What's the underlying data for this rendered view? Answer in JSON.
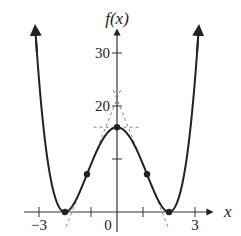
{
  "chart_data": {
    "type": "line",
    "title": "",
    "function": "f(x) = (x^2 - 4)^2 = x^4 - 8x^2 + 16",
    "xlabel": "x",
    "ylabel": "f(x)",
    "xlim": [
      -3.3,
      3.3
    ],
    "ylim": [
      0,
      34
    ],
    "x_ticks": [
      -3,
      -1,
      1,
      3
    ],
    "x_tick_labels": [
      "-3",
      "0",
      "3"
    ],
    "x_tick_label_positions": [
      -3,
      0,
      3
    ],
    "y_ticks": [
      10,
      20,
      30
    ],
    "y_tick_labels": [
      "20",
      "30"
    ],
    "y_tick_label_positions": [
      20,
      30
    ],
    "grid": false,
    "series": [
      {
        "name": "f(x)",
        "x": [
          -3.14,
          -3.0,
          -2.75,
          -2.5,
          -2.25,
          -2.0,
          -1.75,
          -1.5,
          -1.155,
          -1.0,
          -0.75,
          -0.5,
          -0.25,
          0,
          0.25,
          0.5,
          0.75,
          1.0,
          1.155,
          1.5,
          1.75,
          2.0,
          2.25,
          2.5,
          2.75,
          3.0,
          3.14
        ],
        "y": [
          34.0,
          25.0,
          12.6,
          5.06,
          1.13,
          0,
          0.88,
          3.06,
          7.11,
          9.0,
          11.82,
          14.06,
          15.5,
          16,
          15.5,
          14.06,
          11.82,
          9.0,
          7.11,
          3.06,
          0.88,
          0,
          1.13,
          5.06,
          12.6,
          25.0,
          34.0
        ]
      }
    ],
    "marked_points": [
      {
        "x": -2,
        "y": 0,
        "label": "local minimum"
      },
      {
        "x": -1.155,
        "y": 7.11,
        "label": "inflection point"
      },
      {
        "x": 0,
        "y": 16,
        "label": "local maximum"
      },
      {
        "x": 1.155,
        "y": 7.11,
        "label": "inflection point"
      },
      {
        "x": 2,
        "y": 0,
        "label": "local minimum"
      }
    ],
    "dashed_tangent_lines": [
      {
        "at_x": 0,
        "slope": 0,
        "y_intercept": 16
      },
      {
        "at_x": -1.155,
        "slope": 12.32,
        "y_intercept": 21.33
      },
      {
        "at_x": 1.155,
        "slope": -12.32,
        "y_intercept": 21.33
      }
    ],
    "colors": {
      "curve": "#222222",
      "axes": "#333333",
      "dashed": "#777777"
    }
  }
}
